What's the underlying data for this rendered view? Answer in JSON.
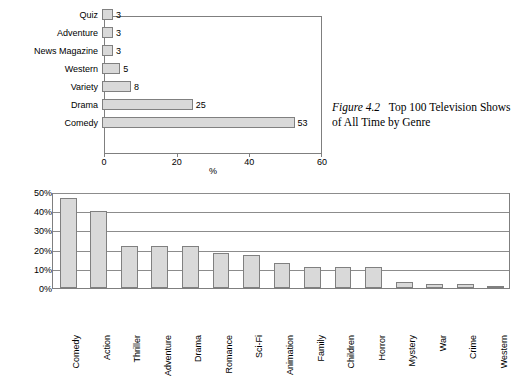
{
  "caption": {
    "figure_number": "Figure 4.2",
    "text": "Top 100 Television Shows of All Time by Genre"
  },
  "chart_data": [
    {
      "type": "bar",
      "orientation": "horizontal",
      "title": "",
      "xlabel": "%",
      "ylabel": "",
      "xlim": [
        0,
        60
      ],
      "xticks": [
        0,
        20,
        40,
        60
      ],
      "grid": false,
      "categories": [
        "Comedy",
        "Drama",
        "Variety",
        "Western",
        "News Magazine",
        "Adventure",
        "Quiz"
      ],
      "values": [
        53,
        25,
        8,
        5,
        3,
        3,
        3
      ],
      "data_labels": [
        "53",
        "25",
        "8",
        "5",
        "3",
        "3",
        "3"
      ]
    },
    {
      "type": "bar",
      "orientation": "vertical",
      "title": "",
      "xlabel": "",
      "ylabel": "",
      "ylim": [
        0,
        50
      ],
      "yticks": [
        0,
        10,
        20,
        30,
        40,
        50
      ],
      "ytick_labels": [
        "0%",
        "10%",
        "20%",
        "30%",
        "40%",
        "50%"
      ],
      "grid": true,
      "categories": [
        "Comedy",
        "Action",
        "Thriller",
        "Adventure",
        "Drama",
        "Romance",
        "Sci-Fi",
        "Animation",
        "Family",
        "Children",
        "Horror",
        "Mystery",
        "War",
        "Crime",
        "Western"
      ],
      "values": [
        47,
        40,
        22,
        22,
        22,
        18,
        17,
        13,
        11,
        11,
        11,
        3,
        2,
        2,
        1
      ]
    }
  ]
}
